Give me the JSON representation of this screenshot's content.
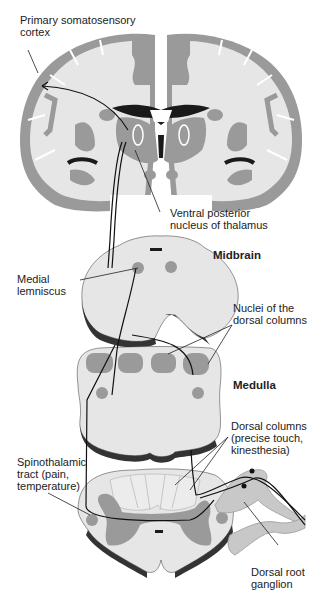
{
  "labels": {
    "cortex": "Primary somatosensory\ncortex",
    "thalamus": "Ventral posterior\nnucleus of thalamus",
    "midbrain": "Midbrain",
    "lemniscus": "Medial\nlemniscus",
    "nuclei": "Nuclei of the\ndorsal columns",
    "medulla": "Medulla",
    "dorsal_columns": "Dorsal columns\n(precise touch,\nkinesthesia)",
    "spinothalamic": "Spinothalamic\ntract (pain,\ntemperature)",
    "ganglion": "Dorsal root\nganglion"
  },
  "colors": {
    "gray_matter": "#9a9a9a",
    "white_matter": "#e6e6e6",
    "ventricle": "#1a1a1a",
    "pathway": "#111111"
  }
}
